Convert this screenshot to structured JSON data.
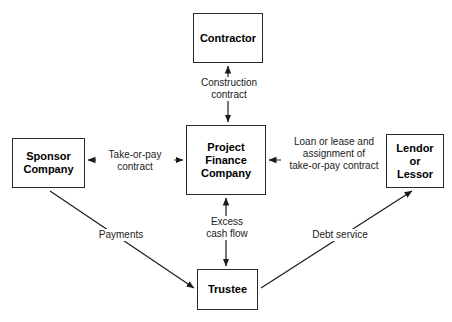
{
  "diagram": {
    "background_color": "#ffffff",
    "line_color": "#2a2a2a",
    "text_color": "#000000",
    "nodes": [
      {
        "id": "contractor",
        "label": "Contractor"
      },
      {
        "id": "project_finance_company",
        "label": "Project\nFinance\nCompany"
      },
      {
        "id": "sponsor_company",
        "label": "Sponsor\nCompany"
      },
      {
        "id": "lendor_or_lessor",
        "label": "Lendor\nor\nLessor"
      },
      {
        "id": "trustee",
        "label": "Trustee"
      }
    ],
    "edge_labels": [
      {
        "id": "construction_contract",
        "label": "Construction\ncontract"
      },
      {
        "id": "take_or_pay_contract",
        "label": "Take-or-pay\ncontract"
      },
      {
        "id": "loan_lease_assignment",
        "label": "Loan or lease and\nassignment of\ntake-or-pay contract"
      },
      {
        "id": "excess_cash_flow",
        "label": "Excess\ncash flow"
      },
      {
        "id": "payments",
        "label": "Payments"
      },
      {
        "id": "debt_service",
        "label": "Debt service"
      }
    ],
    "edges": [
      {
        "id": "contractor-pfc",
        "from": "project_finance_company",
        "to": "contractor",
        "arrows": "both",
        "label": "construction_contract"
      },
      {
        "id": "sponsor-pfc",
        "from": "sponsor_company",
        "to": "project_finance_company",
        "arrows": "both",
        "label": "take_or_pay_contract"
      },
      {
        "id": "pfc-lendor",
        "from": "lendor_or_lessor",
        "to": "project_finance_company",
        "arrows": "both",
        "label": "loan_lease_assignment"
      },
      {
        "id": "pfc-trustee",
        "from": "project_finance_company",
        "to": "trustee",
        "arrows": "both",
        "label": "excess_cash_flow"
      },
      {
        "id": "sponsor-trustee",
        "from": "sponsor_company",
        "to": "trustee",
        "arrows": "end",
        "label": "payments"
      },
      {
        "id": "trustee-lendor",
        "from": "trustee",
        "to": "lendor_or_lessor",
        "arrows": "end",
        "label": "debt_service"
      }
    ]
  }
}
